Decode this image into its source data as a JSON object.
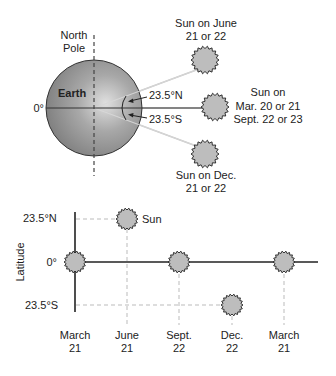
{
  "top_diagram": {
    "north_pole_label": [
      "North",
      "Pole"
    ],
    "earth_label": "Earth",
    "equator_label": "0°",
    "north_angle_label": "23.5°N",
    "south_angle_label": "23.5°S",
    "sun_june_label": [
      "Sun on June",
      "21 or 22"
    ],
    "sun_equinox_label": [
      "Sun on",
      "Mar. 20 or 21",
      "Sept. 22 or 23"
    ],
    "sun_dec_label": [
      "Sun on Dec.",
      "21 or 22"
    ]
  },
  "bottom_graph": {
    "y_axis_title": "Latitude",
    "y_ticks": [
      "23.5°N",
      "0°",
      "23.5°S"
    ],
    "sun_label": "Sun",
    "x_labels": [
      [
        "March",
        "21"
      ],
      [
        "June",
        "21"
      ],
      [
        "Sept.",
        "22"
      ],
      [
        "Dec.",
        "22"
      ],
      [
        "March",
        "21"
      ]
    ]
  },
  "colors": {
    "earth_fill": "#8c8c8c",
    "sun_fill": "#bdbdbd",
    "line": "#222222",
    "guide_line": "#bbbbbb",
    "ray_line": "#c8c8c8"
  }
}
